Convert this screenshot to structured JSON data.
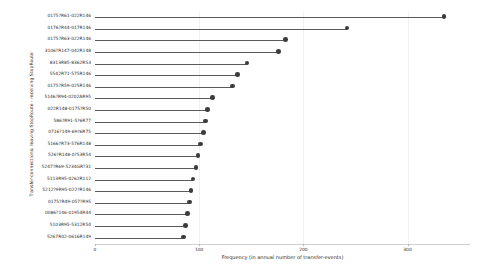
{
  "chart_data": {
    "type": "bar",
    "subtype": "lollipop-horizontal",
    "title": "",
    "xlabel": "Frequency (in annual number of transfer-events)",
    "ylabel": "Transfer-connections: leaving StopRoute - receiving StopRoute",
    "xlim": [
      0,
      360
    ],
    "ylim": null,
    "grid": true,
    "grid_axis": "x",
    "legend": false,
    "xticks": [
      0,
      100,
      200,
      300
    ],
    "xticklabels": [
      "0",
      "100",
      "200",
      "300"
    ],
    "categories": [
      "0175?R61-022R146",
      "0176?R44-017R146",
      "0175?R63-022R146",
      "3106?R147-042R148",
      "8313R85-8362R53",
      "5542R71-575R146",
      "0175?R59-025R146",
      "5146?R94-0202AR95",
      "022R148-0175?R50",
      "586?R91-5?6R77",
      "0716?149-69?6R75",
      "5166?R73-576R148",
      "526?R148-0?53R54",
      "5247?R69-5234GR?31",
      "5113R95-0262R112",
      "5212?9R95-022?R146",
      "0175?R49-057?R95",
      "0086?146-01954R44",
      "5103R95-5312R54",
      "5267R02-0616R149"
    ],
    "values": [
      335,
      242,
      183,
      176,
      146,
      137,
      132,
      113,
      108,
      106,
      104,
      101,
      99,
      97,
      94,
      92,
      91,
      89,
      87,
      85
    ],
    "colors": {
      "marker": "#3c3c3c",
      "stem": "#5a5a5a",
      "grid": "#f0f0f0",
      "axis": "#cfcfcf",
      "text": "#2b2b2b",
      "background": "#ffffff"
    }
  }
}
